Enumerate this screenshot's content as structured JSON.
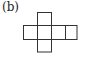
{
  "figure": {
    "label": "(b)",
    "line_color": "#333333",
    "cells": [
      {
        "row": 0,
        "col": 1
      },
      {
        "row": 1,
        "col": 0
      },
      {
        "row": 1,
        "col": 1
      },
      {
        "row": 1,
        "col": 2
      },
      {
        "row": 1,
        "col": 3
      },
      {
        "row": 2,
        "col": 1
      }
    ]
  }
}
